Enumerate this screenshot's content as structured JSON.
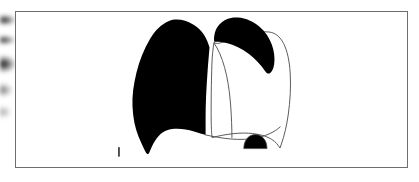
{
  "figure": {
    "frame": {
      "border_color": "#6e6e6e",
      "background_color": "#ffffff",
      "x": 15,
      "y": 11,
      "width": 393,
      "height": 157
    },
    "background_color": "#ffffff",
    "ink_color": "#000000",
    "outline_color": "#4a4a4a",
    "caption_text": "",
    "scale_mark_label": "I",
    "parts": [
      {
        "name": "left-lung-opacified",
        "label": "Left lung (solid black / opacified)",
        "fill": "#000000",
        "stroke": "none"
      },
      {
        "name": "right-lung-outline",
        "label": "Right lung (outlined)",
        "fill": "#ffffff",
        "stroke": "#4a4a4a"
      },
      {
        "name": "right-apical-cap",
        "label": "Right apical cap (black)",
        "fill": "#000000",
        "stroke": "none"
      },
      {
        "name": "right-hemidiaphragm-dome",
        "label": "Right hemidiaphragm dome opacity (black)",
        "fill": "#000000",
        "stroke": "#4a4a4a"
      },
      {
        "name": "horizontal-fissure-line",
        "label": "Fissure line",
        "fill": "none",
        "stroke": "#4a4a4a"
      },
      {
        "name": "diaphragm-line",
        "label": "Diaphragm border line",
        "fill": "none",
        "stroke": "#4a4a4a"
      },
      {
        "name": "scale-tick-mark",
        "label": "I",
        "fill": "#1a1a1a",
        "stroke": "none"
      }
    ]
  }
}
